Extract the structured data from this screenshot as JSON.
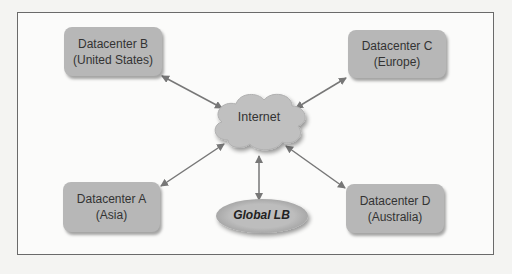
{
  "diagram": {
    "nodes": {
      "dc_b": {
        "line1": "Datacenter B",
        "line2": "(United States)"
      },
      "dc_c": {
        "line1": "Datacenter C",
        "line2": "(Europe)"
      },
      "dc_a": {
        "line1": "Datacenter A",
        "line2": "(Asia)"
      },
      "dc_d": {
        "line1": "Datacenter D",
        "line2": "(Australia)"
      },
      "internet": {
        "label": "Internet"
      },
      "global_lb": {
        "label": "Global LB"
      }
    },
    "edges": [
      {
        "from": "dc_b",
        "to": "internet",
        "type": "bidirectional"
      },
      {
        "from": "dc_c",
        "to": "internet",
        "type": "bidirectional"
      },
      {
        "from": "dc_a",
        "to": "internet",
        "type": "bidirectional"
      },
      {
        "from": "dc_d",
        "to": "internet",
        "type": "bidirectional"
      },
      {
        "from": "global_lb",
        "to": "internet",
        "type": "bidirectional"
      }
    ],
    "colors": {
      "box_fill": "#b7b7b7",
      "cloud_fill": "#c0c0c0",
      "arrow": "#777777",
      "frame": "#6a6a6a"
    }
  }
}
